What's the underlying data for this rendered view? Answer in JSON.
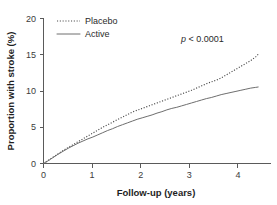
{
  "chart_data": {
    "type": "line",
    "title": "",
    "xlabel": "Follow-up (years)",
    "ylabel": "Proportion with stroke (%)",
    "xlim": [
      0,
      4.6
    ],
    "ylim": [
      0,
      20
    ],
    "xticks": [
      "0",
      "1",
      "2",
      "3",
      "4"
    ],
    "xtick_values": [
      0,
      1,
      2,
      3,
      4
    ],
    "yticks": [
      "0",
      "5",
      "10",
      "15",
      "20"
    ],
    "ytick_values": [
      0,
      5,
      10,
      15,
      20
    ],
    "grid": false,
    "legend_position": "top-left",
    "annotations": [
      {
        "text_italic": "p",
        "text": " < 0.0001",
        "x": 2.95,
        "y": 17.0
      }
    ],
    "series": [
      {
        "name": "Placebo",
        "style": "dotted",
        "color": "#4a4a4a",
        "x": [
          0,
          0.1,
          0.2,
          0.3,
          0.4,
          0.5,
          0.6,
          0.7,
          0.8,
          0.9,
          1.0,
          1.1,
          1.2,
          1.3,
          1.4,
          1.5,
          1.6,
          1.7,
          1.8,
          1.9,
          2.0,
          2.1,
          2.2,
          2.3,
          2.4,
          2.5,
          2.6,
          2.7,
          2.8,
          2.9,
          3.0,
          3.1,
          3.2,
          3.3,
          3.4,
          3.5,
          3.6,
          3.7,
          3.8,
          3.9,
          4.0,
          4.1,
          4.2,
          4.3,
          4.35
        ],
        "y": [
          0,
          0.45,
          0.9,
          1.35,
          1.8,
          2.2,
          2.6,
          3.0,
          3.4,
          3.8,
          4.2,
          4.6,
          5.0,
          5.35,
          5.7,
          6.05,
          6.4,
          6.75,
          7.1,
          7.35,
          7.6,
          7.85,
          8.1,
          8.35,
          8.6,
          8.85,
          9.1,
          9.35,
          9.6,
          9.85,
          10.1,
          10.4,
          10.7,
          11.0,
          11.25,
          11.5,
          11.8,
          12.2,
          12.6,
          13.0,
          13.4,
          13.8,
          14.2,
          14.7,
          15.05
        ]
      },
      {
        "name": "Active",
        "style": "solid",
        "color": "#6e6e6e",
        "x": [
          0,
          0.1,
          0.2,
          0.3,
          0.4,
          0.5,
          0.6,
          0.7,
          0.8,
          0.9,
          1.0,
          1.1,
          1.2,
          1.3,
          1.4,
          1.5,
          1.6,
          1.7,
          1.8,
          1.9,
          2.0,
          2.1,
          2.2,
          2.3,
          2.4,
          2.5,
          2.6,
          2.7,
          2.8,
          2.9,
          3.0,
          3.1,
          3.2,
          3.3,
          3.4,
          3.5,
          3.6,
          3.7,
          3.8,
          3.9,
          4.0,
          4.1,
          4.2,
          4.3,
          4.35
        ],
        "y": [
          0,
          0.4,
          0.85,
          1.3,
          1.7,
          2.1,
          2.45,
          2.8,
          3.1,
          3.4,
          3.65,
          3.95,
          4.25,
          4.55,
          4.8,
          5.1,
          5.35,
          5.6,
          5.85,
          6.1,
          6.3,
          6.5,
          6.7,
          6.95,
          7.15,
          7.4,
          7.6,
          7.75,
          7.95,
          8.15,
          8.35,
          8.55,
          8.75,
          8.95,
          9.1,
          9.3,
          9.5,
          9.65,
          9.8,
          9.95,
          10.1,
          10.25,
          10.4,
          10.5,
          10.55
        ]
      }
    ]
  },
  "legend": {
    "items": [
      {
        "label": "Placebo",
        "style": "dotted"
      },
      {
        "label": "Active",
        "style": "solid"
      }
    ]
  },
  "axes": {
    "x_title": "Follow-up (years)",
    "y_title": "Proportion with stroke (%)"
  },
  "pvalue": {
    "symbol": "p",
    "rest": " < 0.0001"
  }
}
